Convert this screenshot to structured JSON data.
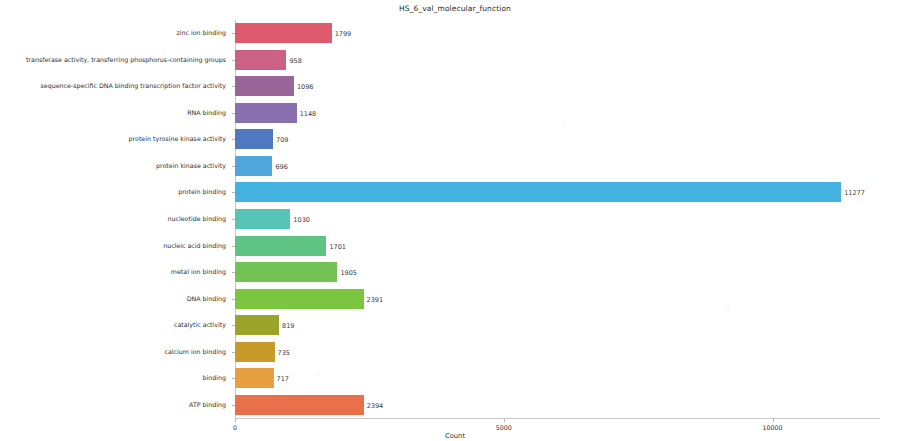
{
  "chart_data": {
    "type": "bar",
    "orientation": "horizontal",
    "title": "HS_6_val_molecular_function",
    "xlabel": "Count",
    "ylabel": "Function",
    "grid": false,
    "legend": "none",
    "xlim": [
      0,
      12000
    ],
    "xticks": [
      0,
      5000,
      10000,
      15000
    ],
    "xtick_labels": [
      "0",
      "5000",
      "10000",
      "15000"
    ],
    "categories": [
      "zinc ion binding",
      "transferase activity, transferring phosphorus-containing groups",
      "sequence-specific DNA binding transcription factor activity",
      "RNA binding",
      "protein tyrosine kinase activity",
      "protein kinase activity",
      "protein binding",
      "nucleotide binding",
      "nucleic acid binding",
      "metal ion binding",
      "DNA binding",
      "catalytic activity",
      "calcium ion binding",
      "binding",
      "ATP binding"
    ],
    "values": [
      1799,
      958,
      1096,
      1148,
      709,
      696,
      11277,
      1030,
      1701,
      1905,
      2391,
      819,
      735,
      717,
      2394
    ],
    "value_labels": [
      "1799",
      "958",
      "1096",
      "1148",
      "709",
      "696",
      "11277",
      "1030",
      "1701",
      "1905",
      "2391",
      "819",
      "735",
      "717",
      "2394"
    ],
    "colors": [
      "#e05a6e",
      "#cc6186",
      "#9a6598",
      "#8a6fae",
      "#4f78c0",
      "#4ea6dd",
      "#43b2e0",
      "#56c4b6",
      "#5fc383",
      "#72c254",
      "#7cc53f",
      "#9aa32a",
      "#c79a2a",
      "#e8a03f",
      "#e8714b"
    ]
  }
}
